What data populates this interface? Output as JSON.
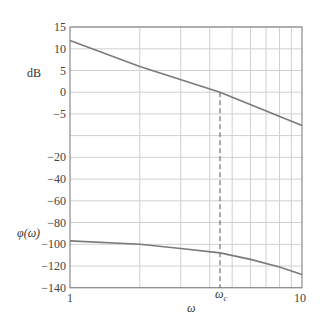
{
  "chart_data": [
    {
      "type": "line",
      "title": "",
      "xlabel": "ω",
      "ylabel": "dB",
      "xscale": "log",
      "xlim": [
        1,
        10
      ],
      "ylim": [
        -10,
        15
      ],
      "x_tick_labels": [
        "1",
        "10"
      ],
      "y_tick_labels": [
        "15",
        "10",
        "5",
        "0",
        "-5"
      ],
      "grid": true,
      "series": [
        {
          "name": "magnitude",
          "x": [
            1,
            2,
            4.43,
            10
          ],
          "values": [
            11.9,
            5.9,
            0,
            -7.7
          ],
          "color": "#777777"
        }
      ],
      "annotations": [
        {
          "type": "vline",
          "x": 4.43,
          "style": "dashed",
          "label": "ωc"
        }
      ]
    },
    {
      "type": "line",
      "title": "",
      "xlabel": "ω",
      "ylabel": "φ(ω)",
      "xscale": "log",
      "xlim": [
        1,
        10
      ],
      "ylim": [
        -140,
        -20
      ],
      "x_tick_labels": [
        "1",
        "10"
      ],
      "y_tick_labels": [
        "-20",
        "-40",
        "-60",
        "-80",
        "-100",
        "-120",
        "-140"
      ],
      "grid": true,
      "series": [
        {
          "name": "phase",
          "x": [
            1,
            2,
            3,
            4.43,
            6,
            8,
            10
          ],
          "values": [
            -97,
            -100,
            -104,
            -108,
            -114,
            -121,
            -128
          ],
          "color": "#777777"
        }
      ],
      "annotations": [
        {
          "type": "vline",
          "x": 4.43,
          "style": "dashed",
          "label": "ωc"
        }
      ]
    }
  ],
  "labels": {
    "db": "dB",
    "phi": "φ(ω)",
    "omega": "ω",
    "omega_c_base": "ω",
    "omega_c_sub": "c",
    "x_min": "1",
    "x_max": "10"
  },
  "y_ticks": [
    {
      "label": "15",
      "y": 27
    },
    {
      "label": "10",
      "y": 48.8
    },
    {
      "label": "5",
      "y": 70.5
    },
    {
      "label": "0",
      "y": 92.2
    },
    {
      "label": "−5",
      "y": 113.9
    },
    {
      "label": "",
      "y": 135.6
    },
    {
      "label": "−20",
      "y": 157.4
    },
    {
      "label": "−40",
      "y": 179.1
    },
    {
      "label": "−60",
      "y": 200.8
    },
    {
      "label": "−80",
      "y": 222.5
    },
    {
      "label": "−100",
      "y": 244.3
    },
    {
      "label": "−120",
      "y": 266
    },
    {
      "label": "−140",
      "y": 287.7
    }
  ],
  "colors": {
    "axis": "#888888",
    "grid": "#d0d0d0",
    "curve": "#7a7a7a",
    "text": "#444444"
  }
}
